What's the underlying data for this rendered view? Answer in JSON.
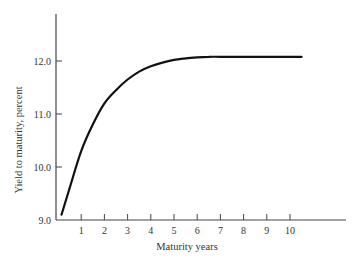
{
  "chart_data": {
    "type": "line",
    "title": "",
    "xlabel": "Maturity years",
    "ylabel": "Yield to maturity, percent",
    "x_ticks": [
      "1",
      "2",
      "3",
      "4",
      "5",
      "6",
      "7",
      "8",
      "9",
      "10"
    ],
    "y_ticks": [
      "9.0",
      "10.0",
      "11.0",
      "12.0"
    ],
    "xlim": [
      0,
      11.5
    ],
    "ylim": [
      9.0,
      12.9
    ],
    "grid": false,
    "legend": null,
    "series": [
      {
        "name": "Yield curve",
        "x": [
          0.15,
          0.5,
          1,
          1.5,
          2,
          2.5,
          3,
          3.5,
          4,
          4.5,
          5,
          5.5,
          6,
          6.5,
          7,
          8,
          9,
          10,
          10.5
        ],
        "y": [
          9.1,
          9.6,
          10.3,
          10.8,
          11.2,
          11.45,
          11.65,
          11.8,
          11.9,
          11.97,
          12.02,
          12.05,
          12.07,
          12.08,
          12.08,
          12.08,
          12.08,
          12.08,
          12.08
        ]
      }
    ]
  }
}
